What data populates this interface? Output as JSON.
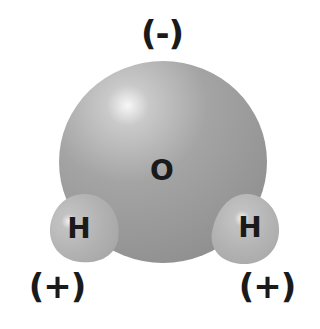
{
  "diagram": {
    "oxygen": {
      "symbol": "O",
      "charge": "(-)",
      "color": "#9a9a9a"
    },
    "hydrogens": [
      {
        "symbol": "H",
        "charge": "(+)",
        "side": "left",
        "color": "#b3b3b3"
      },
      {
        "symbol": "H",
        "charge": "(+)",
        "side": "right",
        "color": "#b3b3b3"
      }
    ]
  }
}
